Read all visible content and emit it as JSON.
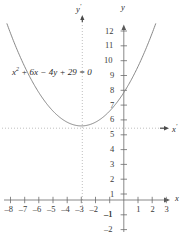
{
  "figure": {
    "kind": "analytic-geometry-parabola-plot",
    "equation_text": "x2 + 6x − 4y + 29 = 0",
    "equation_parts": {
      "var1": "x",
      "exp": "2",
      "rest": " + 6x − 4y + 29 = 0"
    },
    "axis_labels": {
      "x": "x",
      "y": "y",
      "x_prime": "x",
      "y_prime": "y",
      "prime_mark": "′"
    },
    "colors": {
      "curve": "#6f6f6f",
      "axis": "#6b6b6b",
      "dotted": "#b9b9b9",
      "text": "#2b2b2b"
    }
  },
  "chart_data": {
    "type": "line",
    "title": "",
    "subtitle": "",
    "xlabel": "x",
    "ylabel": "y",
    "grid": false,
    "legend_position": "none",
    "annotations": [
      {
        "text": "x2 + 6x − 4y + 29 = 0",
        "x": -7.0,
        "y": 9.2
      },
      {
        "text": "x′",
        "x": 3.6,
        "y": 5.0
      },
      {
        "text": "y′",
        "x": -3.0,
        "y": 13.4
      },
      {
        "text": "x",
        "x": 3.9,
        "y": 0.0
      },
      {
        "text": "y",
        "x": 0.0,
        "y": 13.4
      }
    ],
    "xlim": [
      -8.6,
      3.9
    ],
    "ylim": [
      -2.6,
      13.4
    ],
    "xticks": [
      -8,
      -7,
      -6,
      -5,
      -4,
      -3,
      -2,
      -1,
      1,
      2,
      3
    ],
    "xtick_labels": [
      "–8",
      "–7",
      "–6",
      "–5",
      "–4",
      "–3",
      "–2",
      "–1",
      "1",
      "2",
      "3"
    ],
    "yticks": [
      -2,
      -1,
      1,
      2,
      3,
      4,
      5,
      6,
      7,
      8,
      9,
      10,
      11,
      12
    ],
    "ytick_labels": [
      "–2",
      "–1",
      "1",
      "2",
      "3",
      "4",
      "5",
      "6",
      "7",
      "8",
      "9",
      "10",
      "11",
      "12"
    ],
    "translated_axes": {
      "x_prime_y_value": 5,
      "y_prime_x_value": -3,
      "style": "dotted"
    },
    "vertex": {
      "x": -3,
      "y": 5
    },
    "series": [
      {
        "name": "x^2 + 6x - 4y + 29 = 0",
        "formula": "y = (x^2 + 6x + 29) / 4",
        "x": [
          -8.3,
          -8.0,
          -7.5,
          -7.0,
          -6.5,
          -6.0,
          -5.5,
          -5.0,
          -4.5,
          -4.0,
          -3.5,
          -3.0,
          -2.5,
          -2.0,
          -1.5,
          -1.0,
          -0.5,
          0.0,
          0.5,
          1.0,
          1.5,
          2.0,
          2.3
        ],
        "values": [
          12.0,
          11.25,
          9.88,
          8.5,
          7.56,
          6.75,
          6.06,
          5.5,
          5.06,
          4.75,
          5.06,
          5.0,
          5.06,
          5.25,
          5.56,
          6.0,
          6.56,
          7.25,
          8.06,
          9.0,
          10.06,
          11.25,
          12.0
        ]
      }
    ]
  },
  "ticks": {
    "y": [
      {
        "label": "12",
        "value": 12
      },
      {
        "label": "11",
        "value": 11
      },
      {
        "label": "10",
        "value": 10
      },
      {
        "label": "9",
        "value": 9
      },
      {
        "label": "8",
        "value": 8
      },
      {
        "label": "7",
        "value": 7
      },
      {
        "label": "6",
        "value": 6
      },
      {
        "label": "5",
        "value": 5
      },
      {
        "label": "4",
        "value": 4
      },
      {
        "label": "3",
        "value": 3
      },
      {
        "label": "2",
        "value": 2
      },
      {
        "label": "1",
        "value": 1
      },
      {
        "label": "–1",
        "value": -1
      },
      {
        "label": "–2",
        "value": -2
      }
    ],
    "x": [
      {
        "label": "–8",
        "value": -8
      },
      {
        "label": "–7",
        "value": -7
      },
      {
        "label": "–6",
        "value": -6
      },
      {
        "label": "–5",
        "value": -5
      },
      {
        "label": "–4",
        "value": -4
      },
      {
        "label": "–3",
        "value": -3
      },
      {
        "label": "–2",
        "value": -2
      },
      {
        "label": "–1",
        "value": -1
      },
      {
        "label": "1",
        "value": 1
      },
      {
        "label": "2",
        "value": 2
      },
      {
        "label": "3",
        "value": 3
      }
    ]
  }
}
